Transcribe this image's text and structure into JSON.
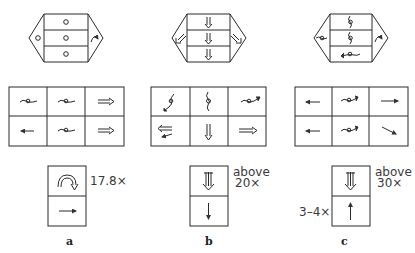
{
  "panels": [
    {
      "id": "a",
      "caption": "a",
      "hexagon": {
        "left_flap": "circle",
        "right_flap": "curved-arrow-clockwise",
        "rows": [
          "circle",
          "circle",
          "circle"
        ]
      },
      "grid": [
        [
          "wavy-circle",
          "wavy-circle",
          "double-arrow-right"
        ],
        [
          "arrow-left",
          "wavy-circle",
          "double-arrow-right"
        ]
      ],
      "stack": {
        "top": "hollow-curved-arrow",
        "bottom": "arrow-right",
        "label_right": "17.8×",
        "label_left": ""
      }
    },
    {
      "id": "b",
      "caption": "b",
      "hexagon": {
        "left_flap": "double-arrow-down-left",
        "right_flap": "double-arrow-down-right",
        "rows": [
          "double-arrow-down",
          "double-arrow-down",
          "double-arrow-down"
        ]
      },
      "grid": [
        [
          "spiral-diagonal",
          "spiral-vertical",
          "wavy-circle-arrow"
        ],
        [
          "double-arrow-left-split",
          "double-arrow-down",
          "double-arrow-right"
        ]
      ],
      "stack": {
        "top": "double-arrow-down-striped",
        "bottom": "arrow-down",
        "label_right_line1": "above",
        "label_right_line2": "20×",
        "label_left": ""
      }
    },
    {
      "id": "c",
      "caption": "c",
      "hexagon": {
        "left_flap": "wavy-circle",
        "right_flap": "curved-arrow-clockwise",
        "rows": [
          "spiral-vertical",
          "spiral-vertical",
          "wavy-circle-arrow-left"
        ]
      },
      "grid": [
        [
          "arrow-left",
          "wavy-circle-arrow",
          "arrow-right"
        ],
        [
          "arrow-left",
          "wavy-circle-arrow",
          "arrow-down-right"
        ]
      ],
      "stack": {
        "top": "double-arrow-down-striped",
        "bottom": "arrow-up",
        "label_right_line1": "above",
        "label_right_line2": "30×",
        "label_left": "3–4×"
      }
    }
  ],
  "colors": {
    "line": "#2a2a2a",
    "icon": "#444444",
    "background": "#ffffff"
  }
}
